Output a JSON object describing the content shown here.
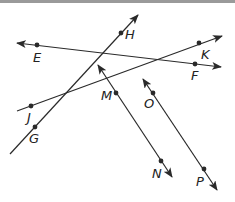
{
  "diagram": {
    "title": "",
    "colors": {
      "line": "#2a2a2a",
      "background": "#ffffff",
      "top_bar": "#9a9a9a"
    },
    "lines": [
      {
        "id": "EF",
        "x1": 17,
        "y1": 43,
        "x2": 221,
        "y2": 67,
        "start_arrow": true,
        "end_arrow": true
      },
      {
        "id": "GH",
        "x1": 10,
        "y1": 154,
        "x2": 138,
        "y2": 15,
        "start_arrow": false,
        "end_arrow": true
      },
      {
        "id": "JK",
        "x1": 17,
        "y1": 111,
        "x2": 222,
        "y2": 36,
        "start_arrow": false,
        "end_arrow": true
      },
      {
        "id": "MN",
        "x1": 98,
        "y1": 65,
        "x2": 172,
        "y2": 177,
        "start_arrow": true,
        "end_arrow": true
      },
      {
        "id": "OP",
        "x1": 143,
        "y1": 79,
        "x2": 217,
        "y2": 190,
        "start_arrow": true,
        "end_arrow": true
      }
    ],
    "points": [
      {
        "name": "E",
        "x": 37,
        "y": 45,
        "lx": 33,
        "ly": 62
      },
      {
        "name": "F",
        "x": 195,
        "y": 64,
        "lx": 191,
        "ly": 80
      },
      {
        "name": "H",
        "x": 121,
        "y": 33,
        "lx": 125,
        "ly": 39
      },
      {
        "name": "G",
        "x": 35,
        "y": 127,
        "lx": 29,
        "ly": 143
      },
      {
        "name": "J",
        "x": 31,
        "y": 106,
        "lx": 27,
        "ly": 122
      },
      {
        "name": "K",
        "x": 199,
        "y": 43,
        "lx": 201,
        "ly": 59
      },
      {
        "name": "M",
        "x": 116,
        "y": 93,
        "lx": 101,
        "ly": 100
      },
      {
        "name": "N",
        "x": 161,
        "y": 161,
        "lx": 152,
        "ly": 178
      },
      {
        "name": "O",
        "x": 153,
        "y": 93,
        "lx": 144,
        "ly": 108
      },
      {
        "name": "P",
        "x": 204,
        "y": 169,
        "lx": 196,
        "ly": 186
      }
    ]
  }
}
